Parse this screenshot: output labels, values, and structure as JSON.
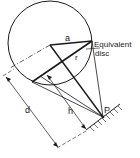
{
  "diagram": {
    "labels": {
      "a": "a",
      "r": "r",
      "equivalent_line1": "Equivalent",
      "equivalent_line2": "disc",
      "d": "d",
      "h": "h",
      "p": "P"
    },
    "caption": "",
    "colors": {
      "stroke": "#1a1a1a",
      "background": "#ffffff"
    }
  }
}
